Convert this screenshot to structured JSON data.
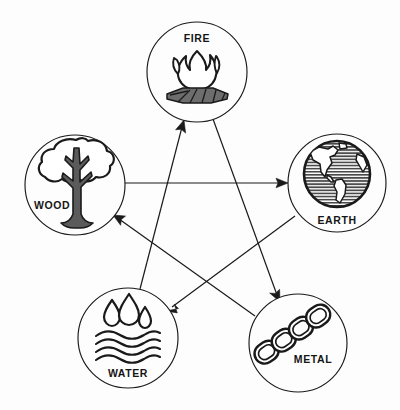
{
  "diagram": {
    "background_color": "#fdfdfd",
    "stroke_color": "#1a1a1a",
    "nodes": [
      {
        "id": "fire",
        "label": "FIRE",
        "icon": "campfire-icon",
        "cx": 197,
        "cy": 72,
        "r": 50,
        "label_x": 197,
        "label_y": 42
      },
      {
        "id": "earth",
        "label": "EARTH",
        "icon": "globe-icon",
        "cx": 337,
        "cy": 183,
        "r": 49,
        "label_x": 337,
        "label_y": 222
      },
      {
        "id": "metal",
        "label": "METAL",
        "icon": "chain-icon",
        "cx": 298,
        "cy": 343,
        "r": 49,
        "label_x": 311,
        "label_y": 361
      },
      {
        "id": "water",
        "label": "WATER",
        "icon": "water-drops-waves-icon",
        "cx": 128,
        "cy": 338,
        "r": 50,
        "label_x": 128,
        "label_y": 375
      },
      {
        "id": "wood",
        "label": "WOOD",
        "icon": "tree-icon",
        "cx": 75,
        "cy": 185,
        "r": 50,
        "label_x": 52,
        "label_y": 207
      }
    ],
    "edges": [
      {
        "id": "wood-to-earth",
        "from": "wood",
        "to": "earth",
        "relation": "Wood controls Earth"
      },
      {
        "id": "earth-to-water",
        "from": "earth",
        "to": "water",
        "relation": "Earth controls Water"
      },
      {
        "id": "water-to-fire",
        "from": "water",
        "to": "fire",
        "relation": "Water controls Fire"
      },
      {
        "id": "fire-to-metal",
        "from": "fire",
        "to": "metal",
        "relation": "Fire controls Metal"
      },
      {
        "id": "metal-to-wood",
        "from": "metal",
        "to": "wood",
        "relation": "Metal controls Wood"
      }
    ]
  }
}
